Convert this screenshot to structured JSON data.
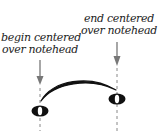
{
  "labels": {
    "left": {
      "line1": "begin centered",
      "line2": "over notehead"
    },
    "right": {
      "line1": "end centered",
      "line2": "over notehead"
    }
  },
  "colors": {
    "text": "#222222",
    "arrow": "#777777",
    "dash": "#888888",
    "slur": "#111111",
    "notehead": "#111111"
  }
}
